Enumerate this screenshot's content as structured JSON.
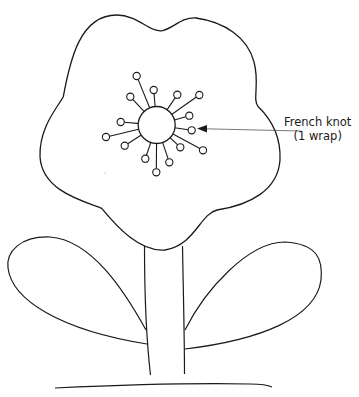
{
  "diagram": {
    "annotation": {
      "line1": "French knot",
      "line2": "(1 wrap)"
    },
    "stroke_color": "#1a1a1a",
    "leader_color": "#555555",
    "center": {
      "cx": 156.7,
      "cy": 125,
      "r": 18.5
    },
    "stamens": [
      {
        "x": 136.7,
        "y": 76
      },
      {
        "x": 153.7,
        "y": 90
      },
      {
        "x": 130.3,
        "y": 96.7
      },
      {
        "x": 177.3,
        "y": 94.7
      },
      {
        "x": 199.3,
        "y": 95
      },
      {
        "x": 189.3,
        "y": 115.7
      },
      {
        "x": 191.7,
        "y": 130.3
      },
      {
        "x": 120.7,
        "y": 122
      },
      {
        "x": 106,
        "y": 137
      },
      {
        "x": 124.7,
        "y": 145.7
      },
      {
        "x": 180.3,
        "y": 147.3
      },
      {
        "x": 203,
        "y": 150.3
      },
      {
        "x": 145.3,
        "y": 158.7
      },
      {
        "x": 169.3,
        "y": 162.3
      },
      {
        "x": 156.3,
        "y": 172.3
      }
    ]
  }
}
